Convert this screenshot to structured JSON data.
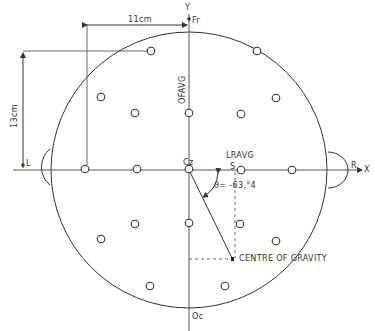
{
  "diagram": {
    "type": "eeg-electrode-map",
    "axes": {
      "x_label": "X",
      "y_label": "Y"
    },
    "landmarks": {
      "front": "Fr",
      "back": "Oc",
      "left": "L",
      "right": "R",
      "center": "Cz"
    },
    "dimensions": {
      "horizontal": "11cm",
      "vertical": "13cm"
    },
    "labels": {
      "ofavg": "OFAVG",
      "lravg": "LRAVG",
      "s_marker": "S",
      "angle": "ϑ= -63,°4",
      "centre_of_gravity": "CENTRE OF GRAVITY"
    },
    "electrodes": [
      {
        "x": 151,
        "y": 51
      },
      {
        "x": 257,
        "y": 51
      },
      {
        "x": 101,
        "y": 97
      },
      {
        "x": 276,
        "y": 98
      },
      {
        "x": 135,
        "y": 113
      },
      {
        "x": 189,
        "y": 113
      },
      {
        "x": 241,
        "y": 114
      },
      {
        "x": 85,
        "y": 169
      },
      {
        "x": 137,
        "y": 169
      },
      {
        "x": 189,
        "y": 169
      },
      {
        "x": 241,
        "y": 170
      },
      {
        "x": 292,
        "y": 170
      },
      {
        "x": 101,
        "y": 239
      },
      {
        "x": 135,
        "y": 224
      },
      {
        "x": 189,
        "y": 223
      },
      {
        "x": 240,
        "y": 224
      },
      {
        "x": 276,
        "y": 241
      },
      {
        "x": 150,
        "y": 286
      },
      {
        "x": 225,
        "y": 286
      }
    ],
    "centre_of_gravity_point": {
      "x": 233,
      "y": 259
    },
    "colors": {
      "line": "#333333",
      "background": "#ffffff"
    }
  }
}
